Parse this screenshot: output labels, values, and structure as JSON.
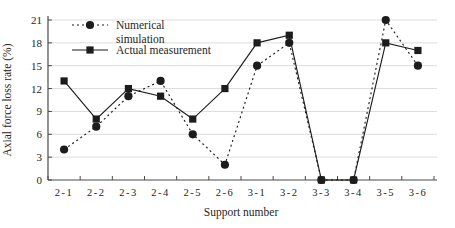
{
  "chart_data": {
    "type": "line",
    "title": "",
    "xlabel": "Support number",
    "ylabel": "Axial force loss rate (%)",
    "categories": [
      "2-1",
      "2-2",
      "2-3",
      "2-4",
      "2-5",
      "2-6",
      "3-1",
      "3-2",
      "3-3",
      "3-4",
      "3-5",
      "3-6"
    ],
    "series": [
      {
        "name": "Numerical simulation",
        "legend_lines": [
          "Numerical",
          "simulation"
        ],
        "marker": "circle",
        "line_style": "dotted",
        "color": "#1c1c1c",
        "values": [
          4,
          7,
          11,
          13,
          6,
          2,
          15,
          18,
          0,
          0,
          21,
          15
        ]
      },
      {
        "name": "Actual measurement",
        "legend_lines": [
          "Actual measurement"
        ],
        "marker": "square",
        "line_style": "solid",
        "color": "#1c1c1c",
        "values": [
          13,
          8,
          12,
          11,
          8,
          12,
          18,
          19,
          0,
          0,
          18,
          17
        ]
      }
    ],
    "ylim": [
      0,
      21
    ],
    "yticks": [
      0,
      3,
      6,
      9,
      12,
      15,
      18,
      21
    ],
    "grid": "horizontal",
    "legend_position": "top-left-inset",
    "colors": {
      "gridline": "#dcdcdc",
      "axis": "#4a4a4a",
      "text": "#262626"
    }
  }
}
